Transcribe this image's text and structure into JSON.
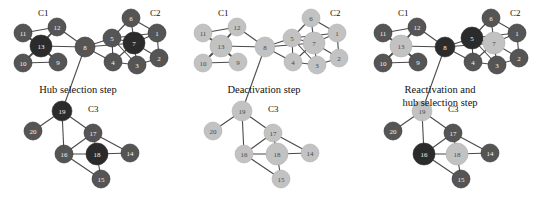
{
  "figure": {
    "background": "#ffffff",
    "node_colors": {
      "active": "#555555",
      "hub": "#2b2b2b",
      "inactive": "#c2c2c2"
    },
    "edge_color": "#4a4a4a",
    "cluster_labels": [
      "C1",
      "C2",
      "C3"
    ]
  },
  "panels": [
    {
      "id": "panel-hub-selection",
      "caption": "Hub selection step",
      "caption_x": 78,
      "caption_y": 84,
      "cluster_label_positions": [
        {
          "label": "C1",
          "x": 38,
          "y": 8
        },
        {
          "label": "C2",
          "x": 150,
          "y": 8
        },
        {
          "label": "C3",
          "x": 88,
          "y": 104
        }
      ],
      "nodes": [
        {
          "id": "11",
          "x": 23,
          "y": 33,
          "r": 9,
          "state": "active"
        },
        {
          "id": "12",
          "x": 57,
          "y": 27,
          "r": 9,
          "state": "active"
        },
        {
          "id": "13",
          "x": 41,
          "y": 46,
          "r": 11,
          "state": "hub"
        },
        {
          "id": "10",
          "x": 23,
          "y": 63,
          "r": 9,
          "state": "active"
        },
        {
          "id": "9",
          "x": 58,
          "y": 62,
          "r": 9,
          "state": "active"
        },
        {
          "id": "8",
          "x": 85,
          "y": 47,
          "r": 10,
          "state": "active"
        },
        {
          "id": "6",
          "x": 131,
          "y": 18,
          "r": 9,
          "state": "active"
        },
        {
          "id": "5",
          "x": 112,
          "y": 38,
          "r": 9,
          "state": "active"
        },
        {
          "id": "7",
          "x": 134,
          "y": 43,
          "r": 11,
          "state": "hub"
        },
        {
          "id": "1",
          "x": 157,
          "y": 33,
          "r": 9,
          "state": "active"
        },
        {
          "id": "4",
          "x": 113,
          "y": 62,
          "r": 9,
          "state": "active"
        },
        {
          "id": "3",
          "x": 137,
          "y": 65,
          "r": 9,
          "state": "active"
        },
        {
          "id": "2",
          "x": 159,
          "y": 58,
          "r": 9,
          "state": "active"
        },
        {
          "id": "19",
          "x": 62,
          "y": 111,
          "r": 10,
          "state": "hub"
        },
        {
          "id": "20",
          "x": 33,
          "y": 131,
          "r": 9,
          "state": "active"
        },
        {
          "id": "17",
          "x": 93,
          "y": 133,
          "r": 9,
          "state": "active"
        },
        {
          "id": "16",
          "x": 64,
          "y": 154,
          "r": 9,
          "state": "active"
        },
        {
          "id": "18",
          "x": 97,
          "y": 154,
          "r": 11,
          "state": "hub"
        },
        {
          "id": "14",
          "x": 130,
          "y": 153,
          "r": 9,
          "state": "active"
        },
        {
          "id": "15",
          "x": 101,
          "y": 179,
          "r": 9,
          "state": "active"
        }
      ]
    },
    {
      "id": "panel-deactivation",
      "caption": "Deactivation step",
      "caption_x": 84,
      "caption_y": 84,
      "cluster_label_positions": [
        {
          "label": "C1",
          "x": 38,
          "y": 8
        },
        {
          "label": "C2",
          "x": 150,
          "y": 8
        },
        {
          "label": "C3",
          "x": 88,
          "y": 104
        }
      ],
      "nodes": [
        {
          "id": "11",
          "x": 23,
          "y": 33,
          "r": 9,
          "state": "inactive"
        },
        {
          "id": "12",
          "x": 57,
          "y": 27,
          "r": 9,
          "state": "inactive"
        },
        {
          "id": "13",
          "x": 41,
          "y": 46,
          "r": 11,
          "state": "inactive"
        },
        {
          "id": "10",
          "x": 23,
          "y": 63,
          "r": 9,
          "state": "inactive"
        },
        {
          "id": "9",
          "x": 58,
          "y": 62,
          "r": 9,
          "state": "inactive"
        },
        {
          "id": "8",
          "x": 85,
          "y": 47,
          "r": 10,
          "state": "inactive"
        },
        {
          "id": "6",
          "x": 131,
          "y": 18,
          "r": 9,
          "state": "inactive"
        },
        {
          "id": "5",
          "x": 112,
          "y": 38,
          "r": 9,
          "state": "inactive"
        },
        {
          "id": "7",
          "x": 134,
          "y": 43,
          "r": 11,
          "state": "inactive"
        },
        {
          "id": "1",
          "x": 157,
          "y": 33,
          "r": 9,
          "state": "inactive"
        },
        {
          "id": "4",
          "x": 113,
          "y": 62,
          "r": 9,
          "state": "inactive"
        },
        {
          "id": "3",
          "x": 137,
          "y": 65,
          "r": 9,
          "state": "inactive"
        },
        {
          "id": "2",
          "x": 159,
          "y": 58,
          "r": 9,
          "state": "inactive"
        },
        {
          "id": "19",
          "x": 62,
          "y": 111,
          "r": 10,
          "state": "inactive"
        },
        {
          "id": "20",
          "x": 33,
          "y": 131,
          "r": 9,
          "state": "inactive"
        },
        {
          "id": "17",
          "x": 93,
          "y": 133,
          "r": 9,
          "state": "inactive"
        },
        {
          "id": "16",
          "x": 64,
          "y": 154,
          "r": 9,
          "state": "inactive"
        },
        {
          "id": "18",
          "x": 97,
          "y": 154,
          "r": 11,
          "state": "inactive"
        },
        {
          "id": "14",
          "x": 130,
          "y": 153,
          "r": 9,
          "state": "inactive"
        },
        {
          "id": "15",
          "x": 101,
          "y": 179,
          "r": 9,
          "state": "inactive"
        }
      ]
    },
    {
      "id": "panel-reactivation",
      "caption": "Reactivation and\nhub selection step",
      "caption_x": 80,
      "caption_y": 84,
      "cluster_label_positions": [
        {
          "label": "C1",
          "x": 38,
          "y": 8
        },
        {
          "label": "C2",
          "x": 150,
          "y": 8
        },
        {
          "label": "C3",
          "x": 88,
          "y": 104
        }
      ],
      "nodes": [
        {
          "id": "11",
          "x": 23,
          "y": 33,
          "r": 9,
          "state": "active"
        },
        {
          "id": "12",
          "x": 57,
          "y": 27,
          "r": 9,
          "state": "active"
        },
        {
          "id": "13",
          "x": 41,
          "y": 46,
          "r": 11,
          "state": "inactive"
        },
        {
          "id": "10",
          "x": 23,
          "y": 63,
          "r": 9,
          "state": "active"
        },
        {
          "id": "9",
          "x": 58,
          "y": 62,
          "r": 9,
          "state": "active"
        },
        {
          "id": "8",
          "x": 85,
          "y": 47,
          "r": 10,
          "state": "hub"
        },
        {
          "id": "6",
          "x": 131,
          "y": 18,
          "r": 9,
          "state": "active"
        },
        {
          "id": "5",
          "x": 112,
          "y": 38,
          "r": 11,
          "state": "hub"
        },
        {
          "id": "7",
          "x": 134,
          "y": 43,
          "r": 11,
          "state": "inactive"
        },
        {
          "id": "1",
          "x": 157,
          "y": 33,
          "r": 9,
          "state": "active"
        },
        {
          "id": "4",
          "x": 113,
          "y": 62,
          "r": 9,
          "state": "active"
        },
        {
          "id": "3",
          "x": 137,
          "y": 65,
          "r": 9,
          "state": "active"
        },
        {
          "id": "2",
          "x": 159,
          "y": 58,
          "r": 9,
          "state": "active"
        },
        {
          "id": "19",
          "x": 62,
          "y": 111,
          "r": 10,
          "state": "inactive"
        },
        {
          "id": "20",
          "x": 33,
          "y": 131,
          "r": 9,
          "state": "active"
        },
        {
          "id": "17",
          "x": 93,
          "y": 133,
          "r": 9,
          "state": "active"
        },
        {
          "id": "16",
          "x": 64,
          "y": 154,
          "r": 11,
          "state": "hub"
        },
        {
          "id": "18",
          "x": 97,
          "y": 154,
          "r": 11,
          "state": "inactive"
        },
        {
          "id": "14",
          "x": 130,
          "y": 153,
          "r": 9,
          "state": "active"
        },
        {
          "id": "15",
          "x": 101,
          "y": 179,
          "r": 9,
          "state": "active"
        }
      ]
    }
  ],
  "edges": [
    [
      "11",
      "12"
    ],
    [
      "11",
      "13"
    ],
    [
      "11",
      "9"
    ],
    [
      "12",
      "13"
    ],
    [
      "12",
      "8"
    ],
    [
      "13",
      "10"
    ],
    [
      "13",
      "9"
    ],
    [
      "13",
      "8"
    ],
    [
      "10",
      "9"
    ],
    [
      "10",
      "12"
    ],
    [
      "8",
      "5"
    ],
    [
      "8",
      "7"
    ],
    [
      "8",
      "4"
    ],
    [
      "8",
      "19"
    ],
    [
      "6",
      "5"
    ],
    [
      "6",
      "7"
    ],
    [
      "6",
      "1"
    ],
    [
      "5",
      "7"
    ],
    [
      "5",
      "4"
    ],
    [
      "5",
      "3"
    ],
    [
      "5",
      "1"
    ],
    [
      "7",
      "1"
    ],
    [
      "7",
      "4"
    ],
    [
      "7",
      "3"
    ],
    [
      "7",
      "2"
    ],
    [
      "1",
      "2"
    ],
    [
      "4",
      "3"
    ],
    [
      "3",
      "2"
    ],
    [
      "19",
      "20"
    ],
    [
      "19",
      "16"
    ],
    [
      "19",
      "17"
    ],
    [
      "17",
      "18"
    ],
    [
      "17",
      "14"
    ],
    [
      "17",
      "16"
    ],
    [
      "16",
      "18"
    ],
    [
      "16",
      "15"
    ],
    [
      "18",
      "14"
    ],
    [
      "18",
      "15"
    ]
  ]
}
